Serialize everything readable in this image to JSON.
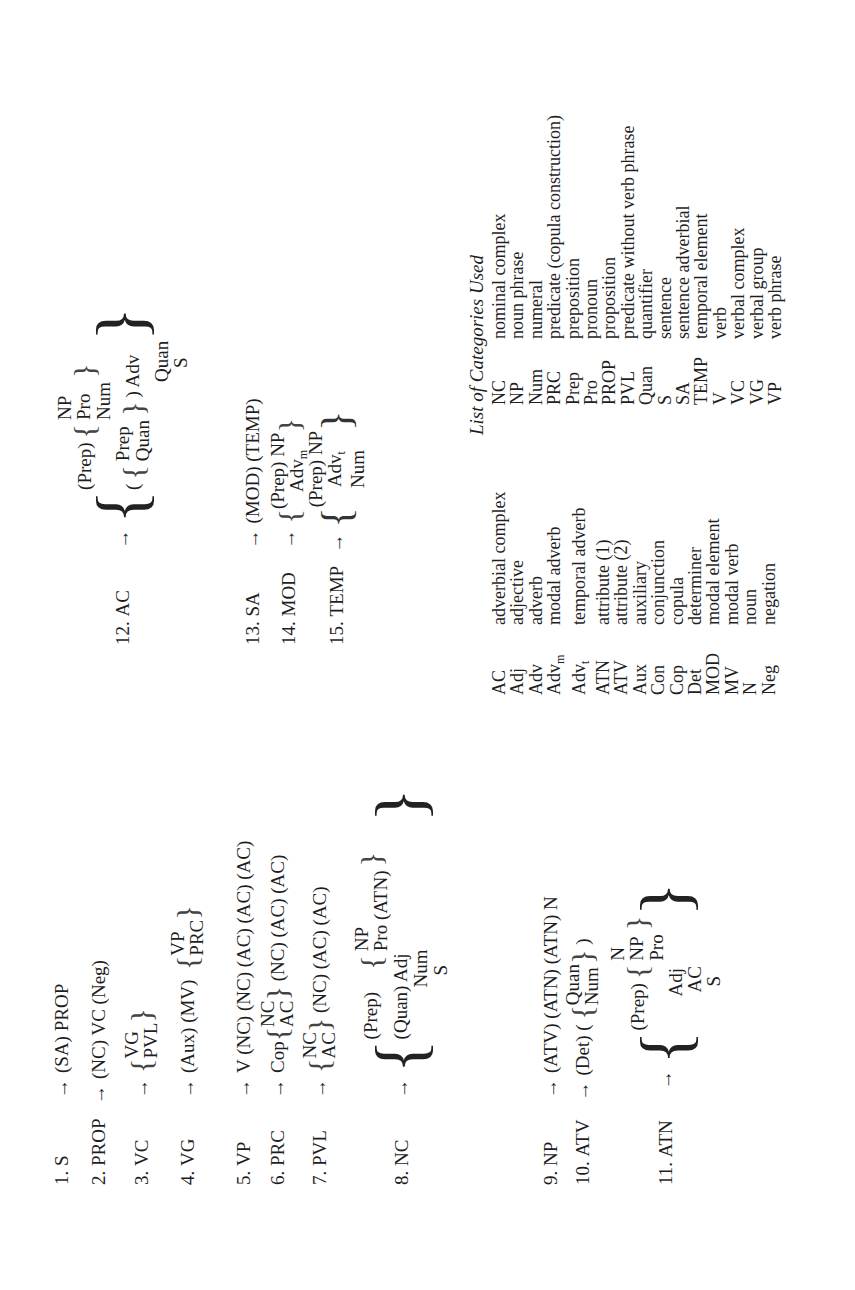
{
  "rules": [
    {
      "num": "1.",
      "lhs": "S",
      "rhs": "(SA) PROP"
    },
    {
      "num": "2.",
      "lhs": "PROP",
      "rhs": "(NC) VC (Neg)"
    },
    {
      "num": "3.",
      "lhs": "VC",
      "options": [
        "VG",
        "PVL"
      ]
    },
    {
      "num": "4.",
      "lhs": "VG",
      "prefix": "(Aux) (MV)",
      "options": [
        "VP",
        "PRC"
      ]
    },
    {
      "num": "5.",
      "lhs": "VP",
      "rhs": "V (NC) (NC) (AC) (AC) (AC)"
    },
    {
      "num": "6.",
      "lhs": "PRC",
      "prefix": "Cop",
      "options": [
        "NC",
        "AC"
      ],
      "suffix": "(NC) (AC) (AC)"
    },
    {
      "num": "7.",
      "lhs": "PVL",
      "options": [
        "NC",
        "AC"
      ],
      "suffix": "(NC) (AC) (AC)"
    },
    {
      "num": "8.",
      "lhs": "NC",
      "line1_prefix": "(Prep)",
      "line1_options": [
        "NP",
        "Pro (ATN)"
      ],
      "line2": "(Quan) Adj",
      "line3": "Num",
      "line4": "S"
    },
    {
      "num": "9.",
      "lhs": "NP",
      "rhs": "(ATV) (ATN) (ATN) N"
    },
    {
      "num": "10.",
      "lhs": "ATV",
      "prefix": "(Det) (",
      "options": [
        "Quan",
        "Num"
      ],
      "suffix": ")"
    },
    {
      "num": "11.",
      "lhs": "ATN",
      "line1_prefix": "(Prep)",
      "line1_options": [
        "N",
        "NP",
        "Pro"
      ],
      "line2": "Adj",
      "line3": "AC",
      "line4": "S"
    },
    {
      "num": "12.",
      "lhs": "AC",
      "line1_prefix": "(Prep)",
      "line1_options": [
        "NP",
        "Pro",
        "Num"
      ],
      "line2_prefix": "(",
      "line2_options": [
        "Prep",
        "Quan"
      ],
      "line2_suffix": ") Adv",
      "line3": "Quan",
      "line4": "S"
    },
    {
      "num": "13.",
      "lhs": "SA",
      "rhs": "(MOD) (TEMP)"
    },
    {
      "num": "14.",
      "lhs": "MOD",
      "options": [
        "(Prep) NP",
        "Adv"
      ],
      "option2_sub": "m"
    },
    {
      "num": "15.",
      "lhs": "TEMP",
      "options": [
        "(Prep) NP",
        "Adv",
        "Num"
      ],
      "option2_sub": "t"
    }
  ],
  "arrow": "→",
  "categories": {
    "title": "List of Categories Used",
    "left": [
      {
        "abbr": "AC",
        "sub": "",
        "label": "adverbial complex"
      },
      {
        "abbr": "Adj",
        "sub": "",
        "label": "adjective"
      },
      {
        "abbr": "Adv",
        "sub": "",
        "label": "adverb"
      },
      {
        "abbr": "Adv",
        "sub": "m",
        "label": "modal adverb"
      },
      {
        "abbr": "Adv",
        "sub": "t",
        "label": "temporal adverb"
      },
      {
        "abbr": "ATN",
        "sub": "",
        "label": "attribute (1)"
      },
      {
        "abbr": "ATV",
        "sub": "",
        "label": "attribute (2)"
      },
      {
        "abbr": "Aux",
        "sub": "",
        "label": "auxiliary"
      },
      {
        "abbr": "Con",
        "sub": "",
        "label": "conjunction"
      },
      {
        "abbr": "Cop",
        "sub": "",
        "label": "copula"
      },
      {
        "abbr": "Det",
        "sub": "",
        "label": "determiner"
      },
      {
        "abbr": "MOD",
        "sub": "",
        "label": "modal element"
      },
      {
        "abbr": "MV",
        "sub": "",
        "label": "modal verb"
      },
      {
        "abbr": "N",
        "sub": "",
        "label": "noun"
      },
      {
        "abbr": "Neg",
        "sub": "",
        "label": "negation"
      }
    ],
    "right": [
      {
        "abbr": "NC",
        "label": "nominal complex"
      },
      {
        "abbr": "NP",
        "label": "noun phrase"
      },
      {
        "abbr": "Num",
        "label": "numeral"
      },
      {
        "abbr": "PRC",
        "label": "predicate (copula construction)"
      },
      {
        "abbr": "Prep",
        "label": "preposition"
      },
      {
        "abbr": "Pro",
        "label": "pronoun"
      },
      {
        "abbr": "PROP",
        "label": "proposition"
      },
      {
        "abbr": "PVL",
        "label": "predicate without verb phrase"
      },
      {
        "abbr": "Quan",
        "label": "quantifier"
      },
      {
        "abbr": "S",
        "label": "sentence"
      },
      {
        "abbr": "SA",
        "label": "sentence adverbial"
      },
      {
        "abbr": "TEMP",
        "label": "temporal element"
      },
      {
        "abbr": "V",
        "label": "verb"
      },
      {
        "abbr": "VC",
        "label": "verbal complex"
      },
      {
        "abbr": "VG",
        "label": "verbal group"
      },
      {
        "abbr": "VP",
        "label": "verb phrase"
      }
    ]
  }
}
